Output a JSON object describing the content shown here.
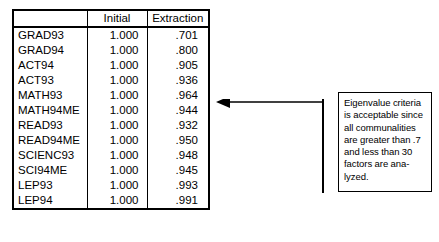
{
  "table": {
    "columns": [
      "",
      "Initial",
      "Extraction"
    ],
    "rows": [
      {
        "label": "GRAD93",
        "initial": "1.000",
        "extraction": ".701"
      },
      {
        "label": "GRAD94",
        "initial": "1.000",
        "extraction": ".800"
      },
      {
        "label": "ACT94",
        "initial": "1.000",
        "extraction": ".905"
      },
      {
        "label": "ACT93",
        "initial": "1.000",
        "extraction": ".936"
      },
      {
        "label": "MATH93",
        "initial": "1.000",
        "extraction": ".964"
      },
      {
        "label": "MATH94ME",
        "initial": "1.000",
        "extraction": ".944"
      },
      {
        "label": "READ93",
        "initial": "1.000",
        "extraction": ".932"
      },
      {
        "label": "READ94ME",
        "initial": "1.000",
        "extraction": ".950"
      },
      {
        "label": "SCIENC93",
        "initial": "1.000",
        "extraction": ".948"
      },
      {
        "label": "SCI94ME",
        "initial": "1.000",
        "extraction": ".945"
      },
      {
        "label": "LEP93",
        "initial": "1.000",
        "extraction": ".993"
      },
      {
        "label": "LEP94",
        "initial": "1.000",
        "extraction": ".991"
      }
    ]
  },
  "annotation": {
    "text": "Eigenvalue criteria\nis acceptable since\nall communalities\nare greater than .7\nand less than 30\nfactors are ana-\nlyzed.",
    "arrow_icon": "arrow-left-icon",
    "line_color": "#000000"
  }
}
